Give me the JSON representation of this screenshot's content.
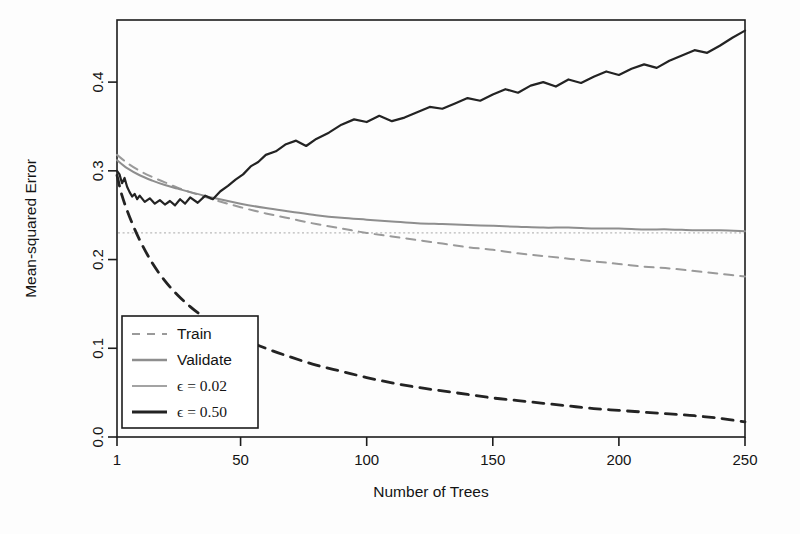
{
  "chart_data": {
    "type": "line",
    "title": "",
    "xlabel": "Number of Trees",
    "ylabel": "Mean-squared Error",
    "xlim": [
      1,
      250
    ],
    "ylim": [
      0.0,
      0.47
    ],
    "xticks": [
      "1",
      "50",
      "100",
      "150",
      "200",
      "250"
    ],
    "xtick_values": [
      1,
      50,
      100,
      150,
      200,
      250
    ],
    "yticks": [
      "0.0",
      "0.1",
      "0.2",
      "0.3",
      "0.4"
    ],
    "ytick_values": [
      0.0,
      0.1,
      0.2,
      0.3,
      0.4
    ],
    "grid": false,
    "legend_position": "bottom-left",
    "reference_line": {
      "name": "bayes-error-dotted",
      "orientation": "horizontal",
      "y": 0.23,
      "style": "dotted",
      "color": "#b9b9b9"
    },
    "series": [
      {
        "name": "Train, epsilon = 0.02",
        "legend_label": "Train",
        "style": "dashed",
        "color": "#9a9a9a",
        "width": 2.0,
        "x": [
          1,
          5,
          10,
          15,
          20,
          25,
          30,
          40,
          50,
          60,
          70,
          80,
          90,
          100,
          110,
          120,
          130,
          140,
          150,
          160,
          170,
          180,
          190,
          200,
          210,
          220,
          230,
          240,
          250
        ],
        "y": [
          0.318,
          0.309,
          0.3,
          0.293,
          0.287,
          0.281,
          0.276,
          0.267,
          0.259,
          0.252,
          0.246,
          0.24,
          0.235,
          0.23,
          0.226,
          0.222,
          0.218,
          0.214,
          0.211,
          0.207,
          0.204,
          0.201,
          0.198,
          0.195,
          0.192,
          0.19,
          0.187,
          0.184,
          0.181
        ]
      },
      {
        "name": "Validate, epsilon = 0.02",
        "legend_label": "Validate",
        "style": "solid",
        "color": "#8e8e8e",
        "width": 2.0,
        "x": [
          1,
          5,
          10,
          15,
          20,
          25,
          30,
          40,
          50,
          60,
          70,
          80,
          90,
          100,
          110,
          120,
          130,
          140,
          150,
          160,
          170,
          180,
          190,
          200,
          210,
          220,
          230,
          240,
          250
        ],
        "y": [
          0.312,
          0.303,
          0.295,
          0.289,
          0.284,
          0.28,
          0.276,
          0.269,
          0.263,
          0.258,
          0.254,
          0.25,
          0.247,
          0.245,
          0.243,
          0.241,
          0.24,
          0.239,
          0.238,
          0.237,
          0.236,
          0.236,
          0.235,
          0.235,
          0.234,
          0.234,
          0.233,
          0.233,
          0.232
        ]
      },
      {
        "name": "Train, epsilon = 0.50",
        "legend_label": "",
        "style": "dashed",
        "color": "#232323",
        "width": 2.8,
        "x": [
          1,
          3,
          6,
          10,
          15,
          20,
          25,
          30,
          35,
          40,
          50,
          60,
          70,
          80,
          90,
          100,
          110,
          120,
          130,
          140,
          150,
          160,
          170,
          180,
          190,
          200,
          210,
          220,
          230,
          240,
          250
        ],
        "y": [
          0.295,
          0.272,
          0.248,
          0.222,
          0.196,
          0.176,
          0.16,
          0.147,
          0.136,
          0.127,
          0.112,
          0.1,
          0.09,
          0.081,
          0.074,
          0.067,
          0.061,
          0.056,
          0.052,
          0.048,
          0.044,
          0.041,
          0.038,
          0.035,
          0.032,
          0.03,
          0.028,
          0.026,
          0.024,
          0.021,
          0.017
        ]
      },
      {
        "name": "Validate, epsilon = 0.50",
        "legend_label": "",
        "style": "solid",
        "color": "#232323",
        "width": 2.2,
        "noisy": true,
        "x": [
          1,
          2,
          3,
          4,
          5,
          6,
          7,
          8,
          9,
          10,
          12,
          14,
          16,
          18,
          20,
          22,
          24,
          26,
          28,
          30,
          33,
          36,
          39,
          42,
          45,
          48,
          51,
          54,
          57,
          60,
          64,
          68,
          72,
          76,
          80,
          85,
          90,
          95,
          100,
          105,
          110,
          115,
          120,
          125,
          130,
          135,
          140,
          145,
          150,
          155,
          160,
          165,
          170,
          175,
          180,
          185,
          190,
          195,
          200,
          205,
          210,
          215,
          220,
          225,
          230,
          235,
          240,
          245,
          250
        ],
        "y": [
          0.3,
          0.296,
          0.286,
          0.292,
          0.282,
          0.276,
          0.271,
          0.274,
          0.268,
          0.272,
          0.265,
          0.269,
          0.263,
          0.267,
          0.262,
          0.266,
          0.261,
          0.268,
          0.263,
          0.27,
          0.264,
          0.272,
          0.268,
          0.277,
          0.283,
          0.29,
          0.296,
          0.305,
          0.31,
          0.318,
          0.322,
          0.33,
          0.334,
          0.328,
          0.336,
          0.343,
          0.352,
          0.358,
          0.355,
          0.362,
          0.356,
          0.36,
          0.366,
          0.372,
          0.37,
          0.376,
          0.382,
          0.379,
          0.386,
          0.392,
          0.388,
          0.396,
          0.4,
          0.395,
          0.403,
          0.399,
          0.406,
          0.412,
          0.408,
          0.415,
          0.42,
          0.416,
          0.424,
          0.43,
          0.436,
          0.433,
          0.441,
          0.45,
          0.458
        ]
      }
    ],
    "legend": [
      {
        "label": "Train",
        "style": "dashed",
        "color": "#9a9a9a",
        "width": 1.8,
        "serif": false
      },
      {
        "label": "Validate",
        "style": "solid",
        "color": "#8e8e8e",
        "width": 2.6,
        "serif": false
      },
      {
        "label": "ϵ = 0.02",
        "style": "solid",
        "color": "#a3a3a3",
        "width": 2.2,
        "serif": true
      },
      {
        "label": "ϵ = 0.50",
        "style": "solid",
        "color": "#232323",
        "width": 2.8,
        "serif": true
      }
    ]
  }
}
